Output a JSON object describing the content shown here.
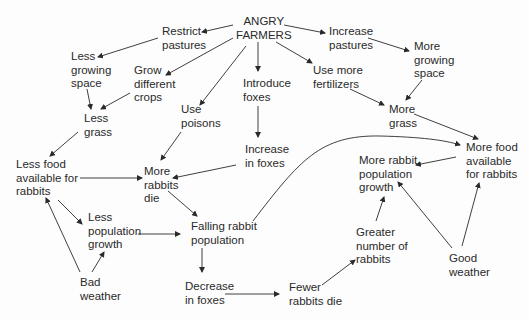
{
  "diagram": {
    "title": "ANGRY\nFARMERS",
    "nodes": {
      "angry_farmers": "ANGRY\nFARMERS",
      "restrict_pastures": "Restrict\npastures",
      "increase_pastures": "Increase\npastures",
      "less_growing_space": "Less\ngrowing\nspace",
      "grow_different_crops": "Grow\ndifferent\ncrops",
      "use_poisons": "Use\npoisons",
      "introduce_foxes": "Introduce\nfoxes",
      "use_more_fertilizers": "Use more\nfertilizers",
      "more_growing_space": "More\ngrowing\nspace",
      "less_grass": "Less\ngrass",
      "more_grass": "More\ngrass",
      "increase_in_foxes": "Increase\nin foxes",
      "less_food": "Less food\navailable for\nrabbits",
      "more_rabbits_die": "More\nrabbits\ndie",
      "more_food": "More food\navailable\nfor rabbits",
      "more_rabbit_growth": "More rabbit\npopulation\ngrowth",
      "less_population_growth": "Less\npopulation\ngrowth",
      "falling_rabbit_population": "Falling rabbit\npopulation",
      "greater_number_of_rabbits": "Greater\nnumber of\nrabbits",
      "good_weather": "Good\nweather",
      "bad_weather": "Bad\nweather",
      "decrease_in_foxes": "Decrease\nin foxes",
      "fewer_rabbits_die": "Fewer\nrabbits die"
    },
    "edges": [
      [
        "angry_farmers",
        "restrict_pastures"
      ],
      [
        "angry_farmers",
        "increase_pastures"
      ],
      [
        "angry_farmers",
        "grow_different_crops"
      ],
      [
        "angry_farmers",
        "use_poisons"
      ],
      [
        "angry_farmers",
        "introduce_foxes"
      ],
      [
        "angry_farmers",
        "use_more_fertilizers"
      ],
      [
        "restrict_pastures",
        "less_growing_space"
      ],
      [
        "increase_pastures",
        "more_growing_space"
      ],
      [
        "less_growing_space",
        "less_grass"
      ],
      [
        "grow_different_crops",
        "less_grass"
      ],
      [
        "less_grass",
        "less_food"
      ],
      [
        "use_poisons",
        "more_rabbits_die"
      ],
      [
        "introduce_foxes",
        "increase_in_foxes"
      ],
      [
        "increase_in_foxes",
        "more_rabbits_die"
      ],
      [
        "use_more_fertilizers",
        "more_grass"
      ],
      [
        "more_growing_space",
        "more_grass"
      ],
      [
        "more_grass",
        "more_food"
      ],
      [
        "less_food",
        "more_rabbits_die"
      ],
      [
        "less_food",
        "less_population_growth"
      ],
      [
        "bad_weather",
        "less_food"
      ],
      [
        "bad_weather",
        "less_population_growth"
      ],
      [
        "less_population_growth",
        "falling_rabbit_population"
      ],
      [
        "more_rabbits_die",
        "falling_rabbit_population"
      ],
      [
        "falling_rabbit_population",
        "more_food"
      ],
      [
        "falling_rabbit_population",
        "decrease_in_foxes"
      ],
      [
        "decrease_in_foxes",
        "fewer_rabbits_die"
      ],
      [
        "fewer_rabbits_die",
        "greater_number_of_rabbits"
      ],
      [
        "greater_number_of_rabbits",
        "more_rabbit_growth"
      ],
      [
        "more_food",
        "more_rabbit_growth"
      ],
      [
        "good_weather",
        "more_rabbit_growth"
      ],
      [
        "good_weather",
        "more_food"
      ]
    ]
  }
}
